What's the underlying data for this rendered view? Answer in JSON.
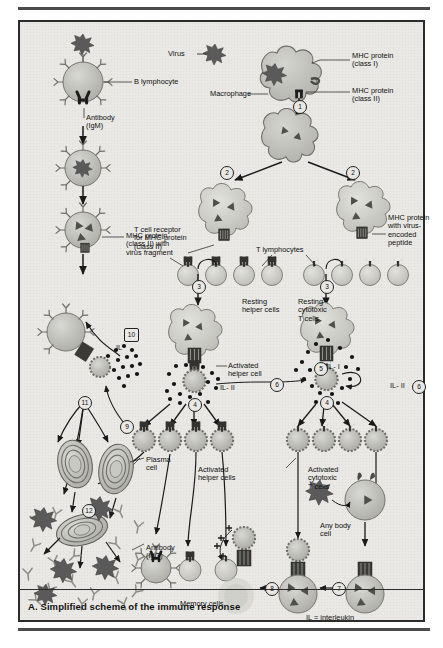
{
  "figure": {
    "caption": "A. Simplified scheme of the immune response",
    "footnote": "IL = interleukin"
  },
  "labels": {
    "virus": "Virus",
    "b_lymphocyte": "B lymphocyte",
    "antibody_igm": "Antibody\n(IgM)",
    "macrophage": "Macrophage",
    "mhc_class_i": "MHC protein\n(class I)",
    "mhc_class_ii": "MHC protein\n(class II)",
    "mhc_class_ii_fragment": "MHC protein\n(class II) with\nvirus fragment",
    "t_cell_receptor": "T cell receptor\nfor MHC-protein\n(class II)",
    "t_lymphocytes": "T lymphocytes",
    "mhc_virus_peptide": "MHC protein\nwith virus-\nencoded\npeptide",
    "resting_helper": "Resting\nhelper cells",
    "resting_cytotoxic": "Resting\ncytotoxic\nT cells",
    "activated_helper_cell": "Activated\nhelper cell",
    "activated_helper_cells": "Activated\nhelper cells",
    "activated_cytotoxic": "Activated\ncytotoxic\nT cells",
    "plasma_cell": "Plasma\ncell",
    "antibody_igg": "Antibody\n(IgG)",
    "memory_cells": "Memory cells",
    "any_body_cell": "Any body\ncell",
    "il_1": "IL- I",
    "il_2_helper": "IL- II",
    "il_2_right": "IL- II",
    "il_near_10": "IL"
  },
  "markers": {
    "m1": "1",
    "m2a": "2",
    "m2b": "2",
    "m3a": "3",
    "m3b": "3",
    "m4a": "4",
    "m4b": "4",
    "m5": "5",
    "m6a": "6",
    "m6b": "6",
    "m7": "7",
    "m8": "8",
    "m9": "9",
    "m10": "10",
    "m11": "11",
    "m12": "12"
  },
  "colors": {
    "panel_background": "#e9e8e4",
    "panel_border": "#2b2b2b",
    "virus_dark": "#5a5a5a",
    "cell_body": "#b9b9b5",
    "cell_light": "#cfcfca",
    "macrophage_fill": "#c3c3be",
    "receptor_dark": "#2f2f2f",
    "interleukin_dot": "#141414",
    "text": "#101010"
  }
}
